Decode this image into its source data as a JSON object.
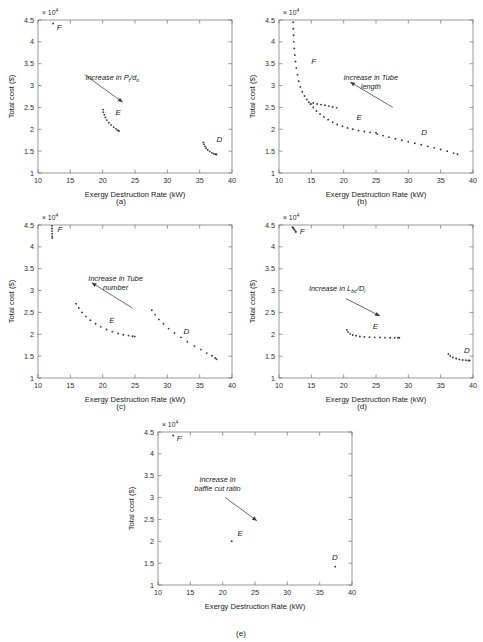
{
  "figure": {
    "axis": {
      "xlabel": "Exergy Destruction Rate (kW)",
      "ylabel": "Total cost ($)",
      "multiplier": "× 10",
      "multiplier_exp": "4",
      "xticks": [
        "10",
        "15",
        "20",
        "25",
        "30",
        "35",
        "40"
      ],
      "yticks": [
        "1",
        "1.5",
        "2",
        "2.5",
        "3",
        "3.5",
        "4",
        "4.5"
      ],
      "xlim": [
        10,
        40
      ],
      "ylim": [
        1,
        4.5
      ]
    },
    "captions": {
      "a": "(a)",
      "b": "(b)",
      "c": "(c)",
      "d": "(d)",
      "e": "(e)"
    },
    "marker_color": "#3c3c3c",
    "axis_color": "#6e6e6e"
  },
  "chart_data": [
    {
      "id": "a",
      "type": "scatter",
      "title": "",
      "xlabel": "Exergy Destruction Rate (kW)",
      "ylabel": "Total cost ($)",
      "xlim": [
        10,
        40
      ],
      "ylim": [
        1,
        4.5
      ],
      "y_multiplier": 10000,
      "grid": false,
      "legend": "none",
      "annotation": {
        "text_parts": [
          "Increase in P",
          "t",
          "/d",
          "o"
        ],
        "text_plain": "Increase in Pt/do",
        "text_x": 21.5,
        "text_y": 3.12,
        "arrow_from": [
          17.2,
          3.25
        ],
        "arrow_to": [
          23.1,
          2.62
        ]
      },
      "point_labels": [
        {
          "name": "F",
          "x": 12.9,
          "y": 4.28
        },
        {
          "name": "E",
          "x": 22.0,
          "y": 2.33
        },
        {
          "name": "D",
          "x": 37.6,
          "y": 1.7
        }
      ],
      "series": [
        {
          "name": "F",
          "x": [
            12.35
          ],
          "y": [
            4.42
          ]
        },
        {
          "name": "E",
          "x": [
            20.05,
            20.12,
            20.25,
            20.42,
            20.65,
            20.95,
            21.3,
            21.7,
            22.05,
            22.3,
            22.45,
            22.5
          ],
          "y": [
            2.45,
            2.39,
            2.33,
            2.27,
            2.21,
            2.15,
            2.1,
            2.05,
            2.01,
            1.98,
            1.965,
            1.96
          ]
        },
        {
          "name": "D",
          "x": [
            35.6,
            35.68,
            35.82,
            36.0,
            36.25,
            36.55,
            36.9,
            37.2,
            37.45,
            37.6
          ],
          "y": [
            1.7,
            1.655,
            1.61,
            1.565,
            1.525,
            1.49,
            1.46,
            1.44,
            1.428,
            1.422
          ]
        }
      ]
    },
    {
      "id": "b",
      "type": "scatter",
      "title": "",
      "xlabel": "Exergy Destruction Rate (kW)",
      "ylabel": "Total cost ($)",
      "xlim": [
        10,
        40
      ],
      "ylim": [
        1,
        4.5
      ],
      "y_multiplier": 10000,
      "grid": false,
      "legend": "none",
      "annotation": {
        "text_parts": [
          "Increase in Tube",
          "length"
        ],
        "text_plain": "Increase in Tube length",
        "text_x": 24.2,
        "text_y": 3.12,
        "arrow_from": [
          27.6,
          2.5
        ],
        "arrow_to": [
          21.0,
          3.08
        ]
      },
      "point_labels": [
        {
          "name": "F",
          "x": 15.0,
          "y": 3.5
        },
        {
          "name": "E",
          "x": 22.0,
          "y": 2.22
        },
        {
          "name": "D",
          "x": 32.0,
          "y": 1.87
        }
      ],
      "series": [
        {
          "name": "F",
          "x": [
            12.2,
            12.22,
            12.25,
            12.3,
            12.36,
            12.44,
            12.55,
            12.68,
            12.85,
            13.05,
            13.3,
            13.6,
            13.95,
            14.3,
            14.62,
            14.9
          ],
          "y": [
            4.45,
            4.3,
            4.15,
            4.0,
            3.85,
            3.7,
            3.55,
            3.4,
            3.25,
            3.1,
            2.97,
            2.86,
            2.76,
            2.68,
            2.62,
            2.58
          ]
        },
        {
          "name": "E",
          "x": [
            14.9,
            15.3,
            15.8,
            16.35,
            16.95,
            17.6,
            18.3,
            19.0,
            19.8,
            20.6,
            21.4,
            22.3,
            23.2,
            24.1,
            25.0
          ],
          "y": [
            2.58,
            2.5,
            2.42,
            2.35,
            2.28,
            2.22,
            2.16,
            2.11,
            2.07,
            2.03,
            2.0,
            1.97,
            1.95,
            1.93,
            1.92
          ]
        },
        {
          "name": "D",
          "x": [
            25.2,
            26.1,
            27.0,
            28.0,
            29.0,
            30.0,
            31.0,
            32.0,
            33.0,
            34.0,
            35.0,
            36.0,
            37.0,
            37.6
          ],
          "y": [
            1.89,
            1.855,
            1.82,
            1.785,
            1.75,
            1.715,
            1.68,
            1.645,
            1.61,
            1.575,
            1.54,
            1.5,
            1.455,
            1.43
          ]
        },
        {
          "name": "F_upper_branch",
          "x": [
            15.3,
            15.9,
            16.5,
            17.1,
            17.7,
            18.3,
            18.9
          ],
          "y": [
            2.6,
            2.58,
            2.565,
            2.55,
            2.53,
            2.51,
            2.49
          ]
        }
      ]
    },
    {
      "id": "c",
      "type": "scatter",
      "title": "",
      "xlabel": "Exergy Destruction Rate (kW)",
      "ylabel": "Total cost ($)",
      "xlim": [
        10,
        40
      ],
      "ylim": [
        1,
        4.5
      ],
      "y_multiplier": 10000,
      "grid": false,
      "legend": "none",
      "annotation": {
        "text_parts": [
          "Increase in Tube",
          "number"
        ],
        "text_plain": "Increase in Tube number",
        "text_x": 22.0,
        "text_y": 3.22,
        "arrow_from": [
          24.6,
          2.6
        ],
        "arrow_to": [
          18.3,
          3.18
        ]
      },
      "point_labels": [
        {
          "name": "F",
          "x": 13.0,
          "y": 4.34
        },
        {
          "name": "E",
          "x": 21.0,
          "y": 2.25
        },
        {
          "name": "D",
          "x": 32.5,
          "y": 2.0
        }
      ],
      "series": [
        {
          "name": "F",
          "x": [
            12.15,
            12.16,
            12.17,
            12.18,
            12.19,
            12.2
          ],
          "y": [
            4.48,
            4.42,
            4.36,
            4.3,
            4.24,
            4.2
          ]
        },
        {
          "name": "E",
          "x": [
            15.9,
            16.3,
            16.8,
            17.4,
            18.1,
            18.9,
            19.7,
            20.6,
            21.5,
            22.4,
            23.2,
            24.0,
            24.6,
            24.95
          ],
          "y": [
            2.7,
            2.6,
            2.5,
            2.41,
            2.32,
            2.24,
            2.17,
            2.11,
            2.06,
            2.02,
            1.99,
            1.97,
            1.955,
            1.95
          ]
        },
        {
          "name": "D",
          "x": [
            27.6,
            28.1,
            28.7,
            29.4,
            30.2,
            31.1,
            32.1,
            33.1,
            34.2,
            35.2,
            36.1,
            36.9,
            37.4,
            37.6
          ],
          "y": [
            2.55,
            2.45,
            2.34,
            2.24,
            2.13,
            2.03,
            1.93,
            1.83,
            1.73,
            1.65,
            1.57,
            1.51,
            1.46,
            1.43
          ]
        }
      ]
    },
    {
      "id": "d",
      "type": "scatter",
      "title": "",
      "xlabel": "Exergy Destruction Rate (kW)",
      "ylabel": "Total cost ($)",
      "xlim": [
        10,
        40
      ],
      "ylim": [
        1,
        4.5
      ],
      "y_multiplier": 10000,
      "grid": false,
      "legend": "none",
      "annotation": {
        "text_parts": [
          "Increase in L",
          "bc",
          "/D",
          "i"
        ],
        "text_plain": "Increase in Lbc/Di",
        "text_x": 19.0,
        "text_y": 3.0,
        "arrow_from": [
          20.3,
          2.82
        ],
        "arrow_to": [
          25.6,
          2.42
        ]
      },
      "point_labels": [
        {
          "name": "F",
          "x": 13.2,
          "y": 4.3
        },
        {
          "name": "E",
          "x": 24.5,
          "y": 2.13
        },
        {
          "name": "D",
          "x": 38.6,
          "y": 1.58
        }
      ],
      "series": [
        {
          "name": "F",
          "x": [
            12.1,
            12.15,
            12.25,
            12.4,
            12.55,
            12.6
          ],
          "y": [
            4.45,
            4.44,
            4.42,
            4.39,
            4.36,
            4.34
          ]
        },
        {
          "name": "E",
          "x": [
            20.5,
            20.7,
            21.0,
            21.4,
            21.9,
            22.5,
            23.2,
            24.0,
            24.8,
            25.6,
            26.4,
            27.2,
            27.9,
            28.4,
            28.6
          ],
          "y": [
            2.1,
            2.05,
            2.01,
            1.985,
            1.965,
            1.95,
            1.94,
            1.935,
            1.93,
            1.925,
            1.923,
            1.921,
            1.92,
            1.92,
            1.92
          ]
        },
        {
          "name": "D",
          "x": [
            36.2,
            36.5,
            36.9,
            37.4,
            37.9,
            38.4,
            38.9,
            39.3,
            39.5
          ],
          "y": [
            1.55,
            1.505,
            1.47,
            1.445,
            1.425,
            1.412,
            1.405,
            1.4,
            1.4
          ]
        }
      ]
    },
    {
      "id": "e",
      "type": "scatter",
      "title": "",
      "xlabel": "Exergy Destruction Rate (kW)",
      "ylabel": "Total cost ($)",
      "xlim": [
        10,
        40
      ],
      "ylim": [
        1,
        4.5
      ],
      "y_multiplier": 10000,
      "grid": false,
      "legend": "none",
      "annotation": {
        "text_parts": [
          "Increase in",
          "baffle cut ratio"
        ],
        "text_plain": "Increase in baffle cut ratio",
        "text_x": 19.2,
        "text_y": 3.35,
        "arrow_from": [
          20.4,
          3.0
        ],
        "arrow_to": [
          25.3,
          2.47
        ]
      },
      "point_labels": [
        {
          "name": "F",
          "x": 12.9,
          "y": 4.3
        },
        {
          "name": "E",
          "x": 22.3,
          "y": 2.13
        },
        {
          "name": "D",
          "x": 36.9,
          "y": 1.58
        }
      ],
      "series": [
        {
          "name": "F",
          "x": [
            12.35
          ],
          "y": [
            4.42
          ]
        },
        {
          "name": "E",
          "x": [
            21.4
          ],
          "y": [
            2.0
          ]
        },
        {
          "name": "D",
          "x": [
            37.4
          ],
          "y": [
            1.42
          ]
        }
      ]
    }
  ]
}
